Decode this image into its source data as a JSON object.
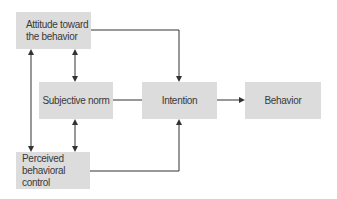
{
  "diagram": {
    "nodes": {
      "attitude": {
        "label_line1": "Attitude toward",
        "label_line2": "the behavior"
      },
      "subjective_norm": {
        "label": "Subjective norm"
      },
      "perceived_control": {
        "label_line1": "Perceived",
        "label_line2": "behavioral control"
      },
      "intention": {
        "label": "Intention"
      },
      "behavior": {
        "label": "Behavior"
      }
    },
    "edges": [
      {
        "from": "attitude",
        "to": "intention",
        "type": "directed"
      },
      {
        "from": "subjective_norm",
        "to": "intention",
        "type": "directed"
      },
      {
        "from": "perceived_control",
        "to": "intention",
        "type": "directed"
      },
      {
        "from": "intention",
        "to": "behavior",
        "type": "directed"
      },
      {
        "from": "attitude",
        "to": "subjective_norm",
        "type": "bidirectional"
      },
      {
        "from": "subjective_norm",
        "to": "perceived_control",
        "type": "bidirectional"
      },
      {
        "from": "attitude",
        "to": "perceived_control",
        "type": "bidirectional"
      }
    ],
    "colors": {
      "box_fill": "#dcdcdc",
      "line": "#333333",
      "text": "#3a3a3a"
    }
  }
}
